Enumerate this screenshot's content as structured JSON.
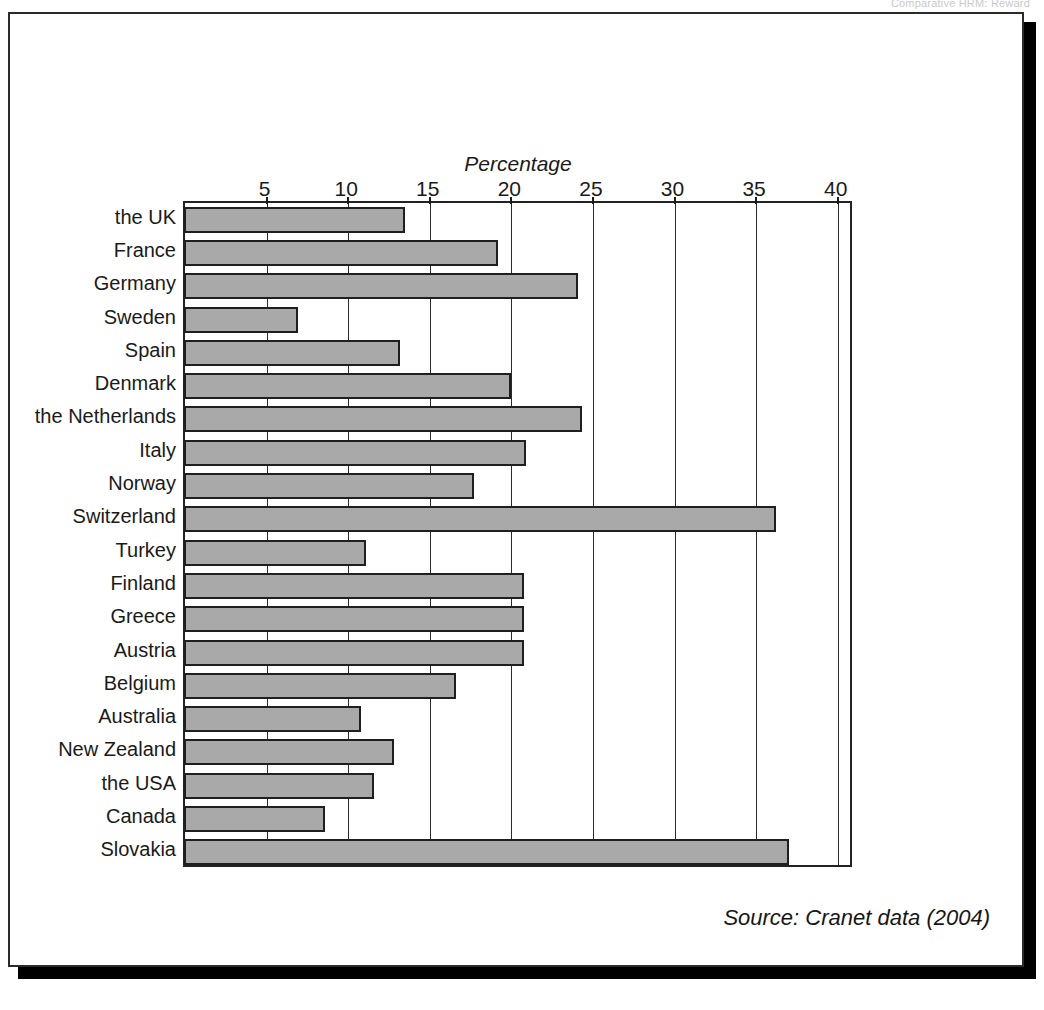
{
  "page_header": "Comparative HRM: Reward",
  "source_note": "Source: Cranet data (2004)",
  "chart_data": {
    "type": "bar",
    "orientation": "horizontal",
    "title": "",
    "xlabel": "Percentage",
    "ylabel": "",
    "xlim": [
      0,
      41
    ],
    "xticks": [
      5,
      10,
      15,
      20,
      25,
      30,
      35,
      40
    ],
    "xtick_labels": [
      "5",
      "10",
      "15",
      "20",
      "25",
      "30",
      "35",
      "40"
    ],
    "grid": true,
    "legend": "none",
    "bar_color": "#a9a9a9",
    "bar_edge_color": "#1f1f1f",
    "categories": [
      "the UK",
      "France",
      "Germany",
      "Sweden",
      "Spain",
      "Denmark",
      "the Netherlands",
      "Italy",
      "Norway",
      "Switzerland",
      "Turkey",
      "Finland",
      "Greece",
      "Austria",
      "Belgium",
      "Australia",
      "New Zealand",
      "the USA",
      "Canada",
      "Slovakia"
    ],
    "values": [
      13.5,
      19.2,
      24.1,
      6.9,
      13.2,
      20.0,
      24.3,
      20.9,
      17.7,
      36.2,
      11.1,
      20.8,
      20.8,
      20.8,
      16.6,
      10.8,
      12.8,
      11.6,
      8.6,
      37.0
    ]
  }
}
